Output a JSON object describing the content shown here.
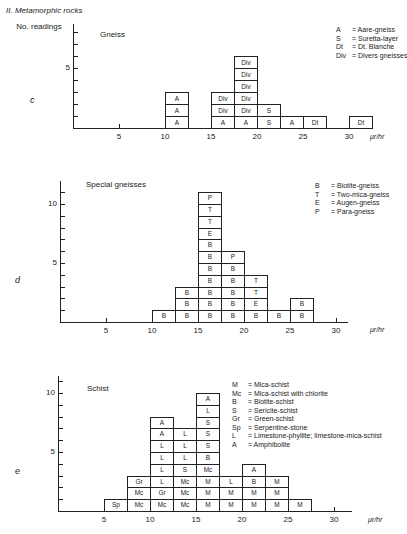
{
  "section_title": "II. Metamorphic rocks",
  "y_axis_label": "No. readings",
  "unit_label": "μr/hr",
  "chart_data": [
    {
      "type": "bar",
      "panel": "c",
      "title": "Gneiss",
      "xlabel": "μr/hr",
      "ylabel": "No. readings",
      "bin_width": 2.5,
      "x_ticks": [
        5,
        10,
        15,
        20,
        25,
        30
      ],
      "y_ticks_labeled": [
        5
      ],
      "ylim": [
        0,
        7
      ],
      "legend": [
        {
          "code": "A",
          "label": "Aare-gneiss"
        },
        {
          "code": "S",
          "label": "Suretta-layer"
        },
        {
          "code": "Dt",
          "label": "Dt. Blanche"
        },
        {
          "code": "Div",
          "label": "Divers gneisses"
        }
      ],
      "bins": [
        {
          "x_start": 10,
          "cells": [
            "A",
            "A",
            "A"
          ]
        },
        {
          "x_start": 15,
          "cells": [
            "A",
            "Div",
            "Div"
          ]
        },
        {
          "x_start": 17.5,
          "cells": [
            "A",
            "Div",
            "Div",
            "Div",
            "Div",
            "Div"
          ]
        },
        {
          "x_start": 20,
          "cells": [
            "S",
            "S"
          ]
        },
        {
          "x_start": 22.5,
          "cells": [
            "A"
          ]
        },
        {
          "x_start": 25,
          "cells": [
            "Dt"
          ]
        },
        {
          "x_start": 30,
          "cells": [
            "Dt"
          ]
        }
      ],
      "categories": [
        "10-12.5",
        "15-17.5",
        "17.5-20",
        "20-22.5",
        "22.5-25",
        "25-27.5",
        "30-32.5"
      ],
      "values": [
        3,
        3,
        6,
        2,
        1,
        1,
        1
      ]
    },
    {
      "type": "bar",
      "panel": "d",
      "title": "Special gneisses",
      "xlabel": "μr/hr",
      "ylabel": "No. readings",
      "bin_width": 2.5,
      "x_ticks": [
        5,
        10,
        15,
        20,
        25,
        30
      ],
      "y_ticks_labeled": [
        5,
        10
      ],
      "ylim": [
        0,
        12
      ],
      "legend": [
        {
          "code": "B",
          "label": "Biotite-gneiss"
        },
        {
          "code": "T",
          "label": "Two-mica-gneiss"
        },
        {
          "code": "E",
          "label": "Augen-gneiss"
        },
        {
          "code": "P",
          "label": "Para-gneiss"
        }
      ],
      "bins": [
        {
          "x_start": 10,
          "cells": [
            "B"
          ]
        },
        {
          "x_start": 12.5,
          "cells": [
            "B",
            "B",
            "B"
          ]
        },
        {
          "x_start": 15,
          "cells": [
            "B",
            "B",
            "B",
            "B",
            "B",
            "B",
            "B",
            "E",
            "T",
            "T",
            "P"
          ]
        },
        {
          "x_start": 17.5,
          "cells": [
            "B",
            "B",
            "B",
            "B",
            "B",
            "P"
          ]
        },
        {
          "x_start": 20,
          "cells": [
            "B",
            "E",
            "T",
            "T"
          ]
        },
        {
          "x_start": 22.5,
          "cells": [
            "B"
          ]
        },
        {
          "x_start": 25,
          "cells": [
            "B",
            "B"
          ]
        }
      ],
      "categories": [
        "10-12.5",
        "12.5-15",
        "15-17.5",
        "17.5-20",
        "20-22.5",
        "22.5-25",
        "25-27.5"
      ],
      "values": [
        1,
        3,
        11,
        6,
        4,
        1,
        2
      ]
    },
    {
      "type": "bar",
      "panel": "e",
      "title": "Schist",
      "xlabel": "μr/hr",
      "ylabel": "No. readings",
      "bin_width": 2.5,
      "x_ticks": [
        5,
        10,
        15,
        20,
        25,
        30
      ],
      "y_ticks_labeled": [
        5,
        10
      ],
      "ylim": [
        0,
        11
      ],
      "legend": [
        {
          "code": "M",
          "label": "Mica-schist"
        },
        {
          "code": "Mc",
          "label": "Mica-schist with chlorite"
        },
        {
          "code": "B",
          "label": "Biotite-schist"
        },
        {
          "code": "S",
          "label": "Sericite-schist"
        },
        {
          "code": "Gr",
          "label": "Green-schist"
        },
        {
          "code": "Sp",
          "label": "Serpentine-stone"
        },
        {
          "code": "L",
          "label": "Limestone-phyllite; limestone-mica-schist"
        },
        {
          "code": "A",
          "label": "Amphibolite"
        }
      ],
      "bins": [
        {
          "x_start": 5,
          "cells": [
            "Sp"
          ]
        },
        {
          "x_start": 7.5,
          "cells": [
            "Mc",
            "Mc",
            "Gr"
          ]
        },
        {
          "x_start": 10,
          "cells": [
            "Mc",
            "Gr",
            "L",
            "L",
            "L",
            "L",
            "A",
            "A"
          ]
        },
        {
          "x_start": 12.5,
          "cells": [
            "Mc",
            "Mc",
            "Mc",
            "S",
            "L",
            "L",
            "L"
          ]
        },
        {
          "x_start": 15,
          "cells": [
            "M",
            "M",
            "M",
            "Mc",
            "B",
            "S",
            "S",
            "S",
            "L",
            "A"
          ]
        },
        {
          "x_start": 17.5,
          "cells": [
            "M",
            "M",
            "L"
          ]
        },
        {
          "x_start": 20,
          "cells": [
            "M",
            "M",
            "B",
            "A"
          ]
        },
        {
          "x_start": 22.5,
          "cells": [
            "M",
            "M",
            "M"
          ]
        },
        {
          "x_start": 25,
          "cells": [
            "M"
          ]
        }
      ],
      "categories": [
        "5-7.5",
        "7.5-10",
        "10-12.5",
        "12.5-15",
        "15-17.5",
        "17.5-20",
        "20-22.5",
        "22.5-25",
        "25-27.5"
      ],
      "values": [
        1,
        3,
        8,
        7,
        10,
        3,
        4,
        3,
        1
      ]
    }
  ]
}
